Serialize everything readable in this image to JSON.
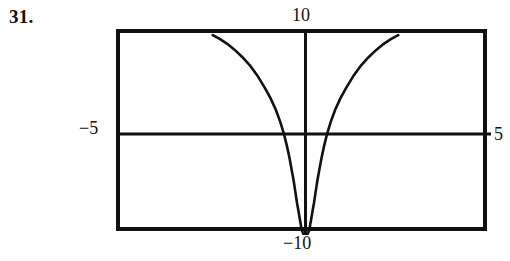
{
  "problem": {
    "number": "31."
  },
  "window_labels": {
    "ymax": "10",
    "ymin": "−10",
    "xmin": "−5",
    "xmax": "5"
  },
  "chart_data": {
    "type": "line",
    "title": "",
    "xlabel": "",
    "ylabel": "",
    "xlim": [
      -5,
      5
    ],
    "ylim": [
      -10,
      10
    ],
    "grid": false,
    "legend": null,
    "axes": {
      "x_axis_drawn": true,
      "y_axis_drawn": true,
      "x_axis_at_y": 0,
      "y_axis_at_x": 0,
      "tick_marks": false,
      "frame": "viewing-window-rectangle"
    },
    "series": [
      {
        "name": "left-branch",
        "x": [
          -2.5,
          -2.3,
          -2.1,
          -1.9,
          -1.7,
          -1.5,
          -1.3,
          -1.1,
          -0.95,
          -0.8,
          -0.68,
          -0.58,
          -0.5,
          -0.43,
          -0.37,
          -0.32,
          -0.27,
          -0.23,
          -0.19,
          -0.16,
          -0.13,
          -0.11,
          -0.09,
          -0.075,
          -0.062,
          -0.052,
          -0.045
        ],
        "y": [
          9.8,
          9.4,
          8.9,
          8.3,
          7.6,
          6.8,
          5.8,
          4.6,
          3.6,
          2.4,
          1.2,
          0.0,
          -1.2,
          -2.4,
          -3.6,
          -4.6,
          -5.8,
          -6.8,
          -7.6,
          -8.3,
          -8.9,
          -9.4,
          -9.6,
          -9.75,
          -9.85,
          -9.9,
          -9.95
        ]
      },
      {
        "name": "right-branch",
        "x": [
          2.5,
          2.3,
          2.1,
          1.9,
          1.7,
          1.5,
          1.3,
          1.1,
          0.95,
          0.8,
          0.68,
          0.58,
          0.5,
          0.43,
          0.37,
          0.32,
          0.27,
          0.23,
          0.19,
          0.16,
          0.13,
          0.11,
          0.09,
          0.075,
          0.062,
          0.052,
          0.045
        ],
        "y": [
          9.8,
          9.4,
          8.9,
          8.3,
          7.6,
          6.8,
          5.8,
          4.6,
          3.6,
          2.4,
          1.2,
          0.0,
          -1.2,
          -2.4,
          -3.6,
          -4.6,
          -5.8,
          -6.8,
          -7.6,
          -8.3,
          -8.9,
          -9.4,
          -9.6,
          -9.75,
          -9.85,
          -9.9,
          -9.95
        ]
      }
    ],
    "colors": {
      "curve": "#111111",
      "axis": "#111111",
      "frame": "#111111",
      "background": "#ffffff"
    }
  }
}
